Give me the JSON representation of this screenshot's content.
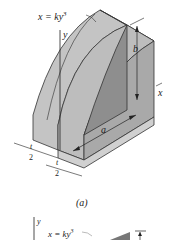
{
  "figure_a": {
    "curve_label": "x = ky",
    "curve_exponent": "3",
    "axis_y": "y",
    "axis_x": "x",
    "dim_b": "b",
    "dim_a": "a",
    "dim_t_num": "t",
    "dim_t_den": "2",
    "caption": "(a)"
  },
  "figure_b": {
    "axis_y": "y",
    "curve_label": "x = ky",
    "curve_exponent": "3"
  },
  "colors": {
    "face_light": "#c9c9c9",
    "face_mid": "#b3b3b3",
    "face_dark": "#8f8f8f",
    "edge": "#333333"
  }
}
